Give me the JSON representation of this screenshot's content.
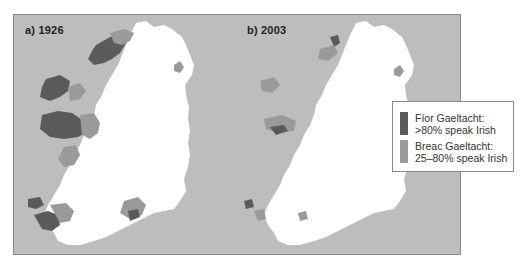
{
  "figure": {
    "panels": [
      {
        "label": "a) 1926",
        "year": 1926
      },
      {
        "label": "b) 2003",
        "year": 2003
      }
    ],
    "legend": {
      "items": [
        {
          "line1": "Fíor Gaeltacht:",
          "line2": ">80% speak Irish",
          "color": "#5a5a5a"
        },
        {
          "line1": "Breac Gaeltacht:",
          "line2": "25–80% speak Irish",
          "color": "#9a9a9a"
        }
      ]
    },
    "colors": {
      "sea": "#bdbdbd",
      "land": "#ffffff",
      "fior": "#5a5a5a",
      "breac": "#9a9a9a",
      "border": "#8a8a8a"
    }
  }
}
